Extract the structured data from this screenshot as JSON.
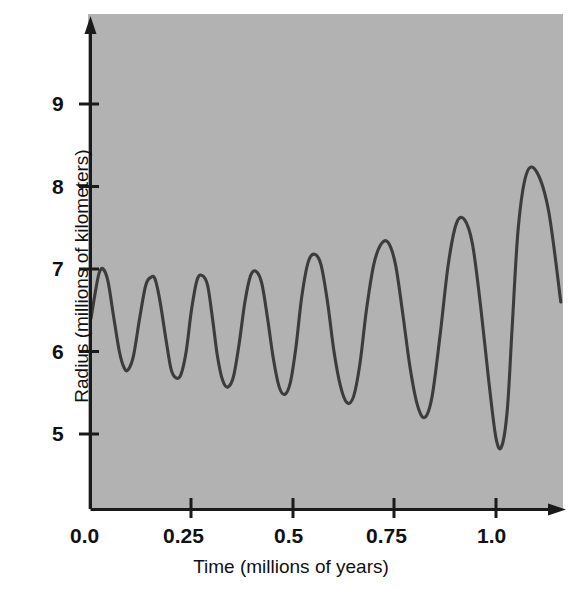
{
  "figure": {
    "background_color": "#ffffff",
    "plot_bg_color": "#b4b4b4",
    "curve_color": "#3c3c3c",
    "axis_color": "#1a1a1a"
  },
  "axes": {
    "x_title": "Time (millions of years)",
    "y_title": "Radius (millions of kilometers)",
    "x_ticks": [
      "0.0",
      "0.25",
      "0.5",
      "0.75",
      "1.0"
    ],
    "y_ticks": [
      "5",
      "6",
      "7",
      "8",
      "9"
    ]
  },
  "chart_data": {
    "type": "line",
    "title": "",
    "xlabel": "Time (millions of years)",
    "ylabel": "Radius (millions of kilometers)",
    "xlim": [
      0.0,
      1.17
    ],
    "ylim": [
      3.91,
      9.9
    ],
    "grid": false,
    "legend": null,
    "x_tick_values": [
      0.0,
      0.25,
      0.5,
      0.75,
      1.0
    ],
    "y_tick_values": [
      5,
      6,
      7,
      8,
      9
    ],
    "series": [
      {
        "name": "Radius",
        "description": "Oscillating orbital radius with slowly growing amplitude, ending in a runaway escape",
        "x": [
          0.0,
          0.01,
          0.02,
          0.03,
          0.042,
          0.055,
          0.07,
          0.082,
          0.092,
          0.105,
          0.12,
          0.135,
          0.148,
          0.158,
          0.17,
          0.185,
          0.198,
          0.21,
          0.222,
          0.235,
          0.248,
          0.262,
          0.275,
          0.288,
          0.3,
          0.312,
          0.325,
          0.338,
          0.352,
          0.366,
          0.38,
          0.394,
          0.408,
          0.422,
          0.436,
          0.45,
          0.464,
          0.478,
          0.492,
          0.506,
          0.52,
          0.536,
          0.552,
          0.568,
          0.584,
          0.6,
          0.616,
          0.632,
          0.648,
          0.664,
          0.68,
          0.698,
          0.716,
          0.734,
          0.752,
          0.77,
          0.788,
          0.806,
          0.824,
          0.842,
          0.862,
          0.882,
          0.902,
          0.922,
          0.942,
          0.962,
          0.982,
          1.0,
          1.014,
          1.028,
          1.04,
          1.055,
          1.075,
          1.1,
          1.13,
          1.16
        ],
        "y": [
          6.4,
          6.7,
          6.95,
          7.0,
          6.85,
          6.45,
          6.0,
          5.8,
          5.78,
          5.95,
          6.4,
          6.8,
          6.9,
          6.88,
          6.62,
          6.15,
          5.78,
          5.68,
          5.72,
          6.0,
          6.5,
          6.87,
          6.92,
          6.8,
          6.4,
          5.95,
          5.65,
          5.57,
          5.7,
          6.1,
          6.6,
          6.92,
          6.97,
          6.82,
          6.4,
          5.92,
          5.58,
          5.48,
          5.62,
          6.05,
          6.65,
          7.08,
          7.18,
          7.05,
          6.6,
          6.0,
          5.58,
          5.38,
          5.45,
          5.85,
          6.5,
          7.05,
          7.3,
          7.32,
          7.05,
          6.45,
          5.8,
          5.35,
          5.2,
          5.45,
          6.2,
          7.05,
          7.55,
          7.6,
          7.3,
          6.55,
          5.65,
          4.95,
          4.85,
          5.3,
          6.3,
          7.5,
          8.15,
          8.18,
          7.7,
          6.6
        ]
      }
    ],
    "annotations": [],
    "notes": [
      "Peak values grow from about 7.0 at t=0.03 to 8.2 at t=0.95",
      "Trough values fall from about 5.78 at t=0.09 to below 4.0 near t=1.03",
      "After the deep minimum near t=1.03 the curve rises steeply to about 9.4 at t=1.10"
    ]
  }
}
